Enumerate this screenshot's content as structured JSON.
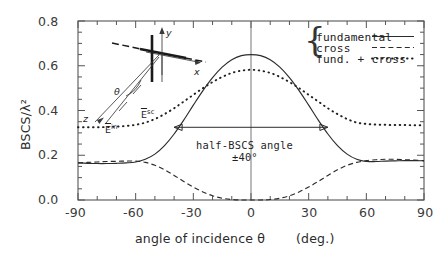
{
  "chart_data": {
    "type": "line",
    "title": "",
    "xlabel": "angle of incidence θ   (deg.)",
    "ylabel": "BSCS/λ²",
    "xlim": [
      -90,
      90
    ],
    "ylim": [
      0.0,
      0.8
    ],
    "grid": false,
    "legend_position": "top-right",
    "xticks": [
      -90,
      -60,
      -30,
      0,
      30,
      60,
      90
    ],
    "xtick_labels": [
      "-90",
      "-60",
      "-30",
      "0",
      "30",
      "60",
      "90"
    ],
    "yticks": [
      0.0,
      0.2,
      0.4,
      0.6,
      0.8
    ],
    "ytick_labels": [
      "0.0",
      "0.2",
      "0.4",
      "0.6",
      "0.8"
    ],
    "x_minor_tick_step": 10,
    "y_minor_tick_step": 0.05,
    "x": [
      -90,
      -85,
      -80,
      -75,
      -70,
      -65,
      -60,
      -55,
      -50,
      -45,
      -40,
      -35,
      -30,
      -25,
      -20,
      -15,
      -10,
      -5,
      0,
      5,
      10,
      15,
      20,
      25,
      30,
      35,
      40,
      45,
      50,
      55,
      60,
      65,
      70,
      75,
      80,
      85,
      90
    ],
    "series": [
      {
        "name": "fundamental",
        "style": "solid",
        "values": [
          0.166,
          0.164,
          0.163,
          0.163,
          0.164,
          0.166,
          0.17,
          0.182,
          0.205,
          0.243,
          0.295,
          0.357,
          0.424,
          0.489,
          0.547,
          0.594,
          0.627,
          0.645,
          0.65,
          0.645,
          0.627,
          0.594,
          0.547,
          0.489,
          0.424,
          0.357,
          0.295,
          0.243,
          0.205,
          0.182,
          0.172,
          0.172,
          0.174,
          0.175,
          0.176,
          0.176,
          0.175
        ]
      },
      {
        "name": "cross",
        "style": "dashed",
        "values": [
          0.166,
          0.168,
          0.17,
          0.172,
          0.173,
          0.174,
          0.174,
          0.168,
          0.155,
          0.135,
          0.11,
          0.083,
          0.058,
          0.036,
          0.019,
          0.008,
          0.002,
          0.0,
          0.0,
          0.0,
          0.002,
          0.008,
          0.019,
          0.036,
          0.058,
          0.083,
          0.11,
          0.135,
          0.155,
          0.168,
          0.176,
          0.18,
          0.182,
          0.182,
          0.18,
          0.178,
          0.176
        ]
      },
      {
        "name": "fund. + cross",
        "style": "dotted",
        "values": [
          0.325,
          0.325,
          0.325,
          0.326,
          0.328,
          0.331,
          0.336,
          0.346,
          0.362,
          0.384,
          0.41,
          0.44,
          0.47,
          0.5,
          0.527,
          0.55,
          0.568,
          0.578,
          0.582,
          0.578,
          0.568,
          0.55,
          0.527,
          0.5,
          0.47,
          0.44,
          0.41,
          0.384,
          0.362,
          0.346,
          0.34,
          0.337,
          0.336,
          0.335,
          0.335,
          0.334,
          0.334
        ]
      }
    ]
  },
  "legend": {
    "brace": "{",
    "items": [
      {
        "label": "fundamental",
        "style": "solid"
      },
      {
        "label": "cross",
        "style": "dashed"
      },
      {
        "label": "fund. + cross",
        "style": "dotted"
      }
    ]
  },
  "annotation": {
    "line1": "half-BSCS angle",
    "line2": "±40°",
    "arrow_from_deg": -40,
    "arrow_to_deg": 40,
    "arrow_y_value": 0.325
  },
  "inset": {
    "axis_x_label": "x",
    "axis_y_label": "y",
    "axis_z_label": "z",
    "incident_field_label": "E",
    "incident_field_sup": "in",
    "scattered_field_label": "E",
    "scattered_field_sup": "sc",
    "angle_label": "θ"
  },
  "axes": {
    "ylabel": "BSCS/λ²",
    "xlabel_main": "angle of incidence θ",
    "xlabel_units": "(deg.)"
  }
}
